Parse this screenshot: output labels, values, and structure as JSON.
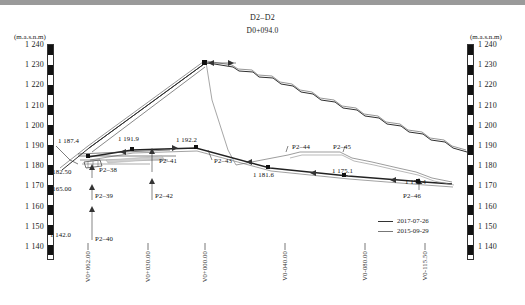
{
  "title": {
    "section": "D2–D2",
    "station": "D0+094.0"
  },
  "axes": {
    "unit_label": "(m.a.s.n.m)",
    "y_ticks": [
      "1 240",
      "1 230",
      "1 220",
      "1 210",
      "1 200",
      "1 190",
      "1 180",
      "1 170",
      "1 160",
      "1 150",
      "1 140"
    ],
    "y_min": 1140,
    "y_max": 1240,
    "x_ticks": [
      "V0+062.00",
      "V0+030.00",
      "V0+000.00",
      "V0-040.00",
      "V0-080.00",
      "V0-115.50"
    ]
  },
  "legend": {
    "entries": [
      {
        "label": "2017-07-26",
        "color": "#333333"
      },
      {
        "label": "2015-09-29",
        "color": "#777777"
      }
    ]
  },
  "annotations": {
    "elevations": [
      {
        "text": "1 187.4",
        "x": 58,
        "y": 137
      },
      {
        "text": "1 182.50",
        "x": 47,
        "y": 168
      },
      {
        "text": "1 165.00",
        "x": 47,
        "y": 185
      },
      {
        "text": "1 142.0",
        "x": 50,
        "y": 231
      },
      {
        "text": "1 191.9",
        "x": 118,
        "y": 135
      },
      {
        "text": "1 192.2",
        "x": 176,
        "y": 136
      },
      {
        "text": "1 181.6",
        "x": 253,
        "y": 171
      },
      {
        "text": "1 175.1",
        "x": 332,
        "y": 167
      },
      {
        "text": "1 170.4",
        "x": 405,
        "y": 178
      }
    ],
    "points": [
      {
        "text": "P2–38",
        "x": 99,
        "y": 166
      },
      {
        "text": "P2–39",
        "x": 95,
        "y": 192
      },
      {
        "text": "P2–40",
        "x": 95,
        "y": 235
      },
      {
        "text": "P2–41",
        "x": 159,
        "y": 157
      },
      {
        "text": "P2–42",
        "x": 155,
        "y": 192
      },
      {
        "text": "P2–43",
        "x": 214,
        "y": 157
      },
      {
        "text": "P2–44",
        "x": 292,
        "y": 143
      },
      {
        "text": "P2–45",
        "x": 333,
        "y": 143
      },
      {
        "text": "P2–46",
        "x": 403,
        "y": 192
      }
    ]
  },
  "chart_data": {
    "type": "line",
    "title": "D2–D2",
    "subtitle": "D0+094.0",
    "xlabel": "",
    "ylabel": "(m.a.s.n.m)",
    "ylim": [
      1140,
      1240
    ],
    "grid": false,
    "legend_position": "bottom-right",
    "series": [
      {
        "name": "2017-07-26",
        "color": "#333333",
        "comment": "dam cross section surface, upstream slope rising to crest then stepped downstream slope",
        "points": [
          [
            62,
            1182.5
          ],
          [
            88,
            1187.4
          ],
          [
            205,
            1232.0
          ],
          [
            232,
            1231.0
          ],
          [
            268,
            1222.0
          ],
          [
            300,
            1210.0
          ],
          [
            330,
            1198.0
          ],
          [
            360,
            1190.0
          ],
          [
            400,
            1180.0
          ],
          [
            440,
            1172.0
          ],
          [
            462,
            1168.0
          ]
        ]
      },
      {
        "name": "2015-09-29",
        "color": "#777777",
        "comment": "previous survey, offset slightly above/outside the 2017 line",
        "points": [
          [
            62,
            1183.0
          ],
          [
            88,
            1188.0
          ],
          [
            205,
            1233.0
          ],
          [
            232,
            1232.0
          ],
          [
            268,
            1223.0
          ],
          [
            300,
            1211.0
          ],
          [
            330,
            1199.0
          ],
          [
            360,
            1191.0
          ],
          [
            400,
            1181.0
          ],
          [
            440,
            1173.0
          ],
          [
            462,
            1169.0
          ]
        ]
      },
      {
        "name": "instrument-line",
        "color": "#333333",
        "comment": "lower inclinometer/settlement gauge alignment through P2-38..P2-46",
        "points": [
          [
            88,
            1187.4
          ],
          [
            132,
            1191.9
          ],
          [
            196,
            1192.2
          ],
          [
            268,
            1181.6
          ],
          [
            345,
            1175.1
          ],
          [
            420,
            1170.4
          ],
          [
            455,
            1168.5
          ]
        ]
      }
    ],
    "measurement_points": [
      {
        "id": "P2–38",
        "elevation": 1182.5
      },
      {
        "id": "P2–39",
        "elevation": 1165.0
      },
      {
        "id": "P2–40",
        "elevation": 1142.0
      },
      {
        "id": "P2–41",
        "elevation": 1191.9
      },
      {
        "id": "P2–42",
        "elevation": null
      },
      {
        "id": "P2–43",
        "elevation": 1192.2
      },
      {
        "id": "P2–44",
        "elevation": null
      },
      {
        "id": "P2–45",
        "elevation": 1175.1
      },
      {
        "id": "P2–46",
        "elevation": 1170.4
      }
    ]
  }
}
